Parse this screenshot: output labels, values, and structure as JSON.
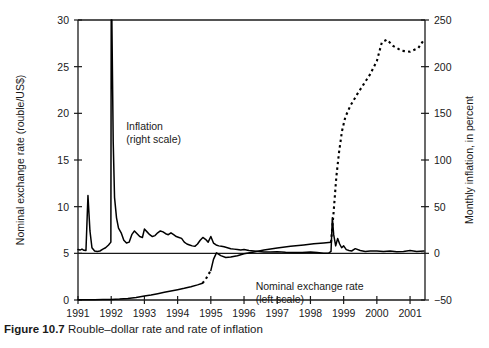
{
  "caption": {
    "number": "Figure 10.7",
    "text": "Rouble–dollar rate and rate of inflation"
  },
  "chart_data": {
    "type": "line",
    "title": "",
    "xlabel": "",
    "ylabel": "Nominal exchange rate (rouble/US$)",
    "y2label": "Monthly inflation, in percent",
    "grid": false,
    "legend_position": "inline-annotations",
    "xlim": [
      1991.0,
      2001.45
    ],
    "xticks": [
      1991,
      1992,
      1993,
      1994,
      1995,
      1996,
      1997,
      1998,
      1999,
      2000,
      2001
    ],
    "xticklabels": [
      "1991",
      "1992",
      "1993",
      "1994",
      "1995",
      "1996",
      "1997",
      "1998",
      "1999",
      "2000",
      "2001"
    ],
    "ylim": [
      30,
      0
    ],
    "yticks": [
      0,
      5,
      10,
      15,
      20,
      25,
      30
    ],
    "yticklabels": [
      "0",
      "5",
      "10",
      "15",
      "20",
      "25",
      "30"
    ],
    "y2lim": [
      -50,
      250
    ],
    "y2ticks": [
      250,
      200,
      150,
      100,
      50,
      0,
      -50
    ],
    "y2ticklabels": [
      "250",
      "200",
      "150",
      "100",
      "50",
      "0",
      "−50"
    ],
    "annotations": [
      {
        "name": "nominal-exchange-rate",
        "lines": [
          "Nominal exchange rate",
          "(left scale)"
        ],
        "x": 1996.35,
        "y_axis": "left",
        "y": 1.05
      },
      {
        "name": "inflation",
        "lines": [
          "Inflation",
          "(right scale)"
        ],
        "x": 1992.45,
        "y_axis": "left",
        "y": 18.2
      }
    ],
    "series": [
      {
        "name": "Nominal exchange rate (left scale)",
        "axis": "left",
        "style": "solid",
        "note": "solid except dashed gaps at late-1994 and after Aug-1998",
        "x": [
          1991.0,
          1991.25,
          1991.5,
          1991.75,
          1992.0,
          1992.25,
          1992.5,
          1992.75,
          1993.0,
          1993.2,
          1993.4,
          1993.6,
          1993.8,
          1994.0,
          1994.2,
          1994.4,
          1994.6,
          1994.75
        ],
        "values": [
          0.03,
          0.04,
          0.04,
          0.05,
          0.06,
          0.1,
          0.16,
          0.26,
          0.42,
          0.54,
          0.68,
          0.82,
          0.96,
          1.1,
          1.25,
          1.42,
          1.62,
          1.8
        ]
      },
      {
        "name": "Nominal exchange rate dashed gap 1994",
        "axis": "left",
        "style": "dashed",
        "x": [
          1994.75,
          1994.85,
          1994.92,
          1995.0
        ],
        "values": [
          1.8,
          2.25,
          2.7,
          3.15
        ]
      },
      {
        "name": "Nominal exchange rate post-1995",
        "axis": "left",
        "style": "solid",
        "x": [
          1995.0,
          1995.08,
          1995.17,
          1995.3,
          1995.45,
          1995.6,
          1995.8,
          1996.0,
          1996.3,
          1996.6,
          1997.0,
          1997.4,
          1997.8,
          1998.1,
          1998.4,
          1998.62
        ],
        "values": [
          3.15,
          4.35,
          5.05,
          4.75,
          4.55,
          4.6,
          4.75,
          4.95,
          5.15,
          5.35,
          5.58,
          5.75,
          5.9,
          6.02,
          6.12,
          6.18
        ]
      },
      {
        "name": "Nominal exchange rate crisis dashed",
        "axis": "left",
        "style": "dashed",
        "x": [
          1998.62,
          1998.7,
          1998.78,
          1998.86,
          1998.95,
          1999.05,
          1999.2,
          1999.4,
          1999.6,
          1999.8,
          2000.0,
          2000.15,
          2000.3,
          2000.5,
          2000.75,
          2001.0,
          2001.25,
          2001.42
        ],
        "values": [
          6.18,
          9.5,
          13.2,
          15.8,
          18.1,
          19.6,
          20.8,
          22.0,
          23.1,
          24.2,
          25.6,
          27.6,
          27.9,
          27.2,
          26.7,
          26.6,
          27.0,
          27.9
        ]
      },
      {
        "name": "Inflation (right scale)",
        "axis": "right",
        "style": "solid",
        "x": [
          1991.0,
          1991.06,
          1991.12,
          1991.18,
          1991.24,
          1991.3,
          1991.36,
          1991.42,
          1991.5,
          1991.58,
          1991.66,
          1991.75,
          1991.83,
          1991.92,
          1991.99,
          1992.0,
          1992.02,
          1992.06,
          1992.1,
          1992.16,
          1992.22,
          1992.3,
          1992.38,
          1992.46,
          1992.54,
          1992.62,
          1992.7,
          1992.78,
          1992.86,
          1992.94,
          1993.0,
          1993.08,
          1993.16,
          1993.24,
          1993.32,
          1993.4,
          1993.48,
          1993.56,
          1993.64,
          1993.72,
          1993.8,
          1993.88,
          1993.96,
          1994.04,
          1994.12,
          1994.2,
          1994.28,
          1994.36,
          1994.44,
          1994.52,
          1994.6,
          1994.68,
          1994.76,
          1994.84,
          1994.92,
          1995.0,
          1995.08,
          1995.16,
          1995.24,
          1995.32,
          1995.4,
          1995.5,
          1995.6,
          1995.7,
          1995.8,
          1995.9,
          1996.0,
          1996.15,
          1996.3,
          1996.45,
          1996.6,
          1996.8,
          1997.0,
          1997.25,
          1997.5,
          1997.75,
          1998.0,
          1998.2,
          1998.4,
          1998.55,
          1998.62,
          1998.66,
          1998.7,
          1998.76,
          1998.82,
          1998.88,
          1998.94,
          1999.0,
          1999.08,
          1999.16,
          1999.24,
          1999.35,
          1999.5,
          1999.65,
          1999.8,
          2000.0,
          2000.2,
          2000.4,
          2000.6,
          2000.8,
          2001.0,
          2001.2,
          2001.42
        ],
        "values": [
          4.0,
          3.5,
          4.5,
          3.2,
          3.0,
          62.0,
          24.0,
          6.0,
          2.5,
          2.0,
          2.5,
          4.5,
          6.0,
          9.0,
          12.0,
          250.0,
          250.0,
          120.0,
          60.0,
          38.0,
          27.0,
          22.0,
          14.0,
          11.0,
          12.0,
          20.0,
          24.0,
          21.0,
          18.0,
          17.0,
          26.0,
          23.0,
          20.0,
          18.0,
          19.0,
          22.0,
          24.0,
          23.0,
          21.0,
          20.0,
          22.0,
          20.0,
          18.0,
          17.0,
          16.0,
          12.0,
          10.0,
          9.0,
          8.0,
          7.5,
          10.0,
          14.0,
          17.0,
          15.0,
          12.0,
          18.0,
          11.0,
          9.0,
          8.0,
          7.5,
          7.0,
          6.0,
          5.0,
          4.5,
          4.0,
          3.5,
          4.0,
          3.0,
          2.5,
          2.0,
          1.5,
          1.4,
          1.8,
          1.2,
          1.0,
          0.8,
          1.5,
          0.8,
          0.2,
          0.3,
          2.0,
          38.0,
          20.0,
          8.0,
          16.0,
          10.0,
          6.0,
          8.0,
          4.0,
          3.0,
          2.5,
          5.0,
          3.0,
          2.0,
          2.5,
          2.5,
          2.0,
          2.5,
          1.8,
          2.0,
          3.0,
          2.0,
          2.5
        ]
      }
    ]
  }
}
